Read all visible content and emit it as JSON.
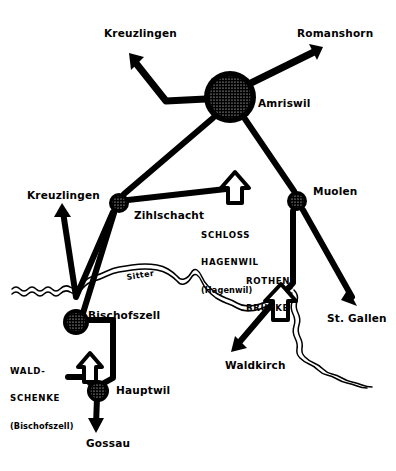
{
  "diagram": {
    "stroke_color": "#000000",
    "background_color": "#ffffff"
  },
  "nodes": [
    {
      "id": "amriswil",
      "label": "Amriswil",
      "kind": "major-hub",
      "cx": 230,
      "cy": 97,
      "r": 26
    },
    {
      "id": "zihlschacht",
      "label": "Zihlschacht",
      "kind": "junction",
      "cx": 119,
      "cy": 203,
      "r": 10
    },
    {
      "id": "muolen",
      "label": "Muolen",
      "kind": "junction",
      "cx": 297,
      "cy": 201,
      "r": 10
    },
    {
      "id": "bischofszell",
      "label": "Bischofszell",
      "kind": "junction",
      "cx": 76,
      "cy": 322,
      "r": 13
    },
    {
      "id": "hauptwil",
      "label": "Hauptwil",
      "kind": "junction",
      "cx": 98,
      "cy": 391,
      "r": 11
    }
  ],
  "destinations": [
    {
      "id": "kreuzlingen-north",
      "label": "Kreuzlingen",
      "x": 104,
      "y": 28
    },
    {
      "id": "romanshorn",
      "label": "Romanshorn",
      "x": 297,
      "y": 28
    },
    {
      "id": "kreuzlingen-west",
      "label": "Kreuzlingen",
      "x": 27,
      "y": 190
    },
    {
      "id": "st-gallen",
      "label": "St. Gallen",
      "x": 327,
      "y": 317
    },
    {
      "id": "waldkirch",
      "label": "Waldkirch",
      "x": 225,
      "y": 364
    },
    {
      "id": "gossau",
      "label": "Gossau",
      "x": 86,
      "y": 442
    }
  ],
  "landmarks": [
    {
      "id": "schloss-hagenwil",
      "line1": "SCHLOSS",
      "line2": "HAGENWIL",
      "line3": "(Hagenwil)",
      "marker": "up-arrow",
      "x": 201,
      "y": 214
    },
    {
      "id": "rothenbruecke",
      "line1": "ROTHEN-",
      "line2": "BRÜCKE",
      "line3": "",
      "marker": "up-arrow",
      "x": 246,
      "y": 259
    },
    {
      "id": "waldschenke",
      "line1": "WALD-",
      "line2": "SCHENKE",
      "line3": "(Bischofszell)",
      "marker": "up-arrow",
      "x": 12,
      "y": 349
    }
  ],
  "rivers": [
    {
      "id": "sitter",
      "label": "Sitter",
      "x": 126,
      "y": 272
    }
  ],
  "routes": [
    {
      "from": "amriswil",
      "to": "kreuzlingen-north",
      "arrow": true
    },
    {
      "from": "amriswil",
      "to": "romanshorn",
      "arrow": true
    },
    {
      "from": "amriswil",
      "to": "zihlschacht",
      "arrow": false
    },
    {
      "from": "amriswil",
      "to": "muolen",
      "arrow": false
    },
    {
      "from": "zihlschacht",
      "to": "schloss-hagenwil",
      "arrow": false
    },
    {
      "from": "zihlschacht",
      "to": "kreuzlingen-west",
      "arrow": true
    },
    {
      "from": "zihlschacht",
      "to": "bischofszell",
      "arrow": false
    },
    {
      "from": "muolen",
      "to": "st-gallen",
      "arrow": true
    },
    {
      "from": "muolen",
      "to": "rothenbruecke",
      "arrow": false
    },
    {
      "from": "rothenbruecke",
      "to": "waldkirch",
      "arrow": true
    },
    {
      "from": "bischofszell",
      "to": "hauptwil",
      "arrow": false
    },
    {
      "from": "bischofszell",
      "to": "waldschenke",
      "arrow": false
    },
    {
      "from": "hauptwil",
      "to": "gossau",
      "arrow": true
    }
  ]
}
